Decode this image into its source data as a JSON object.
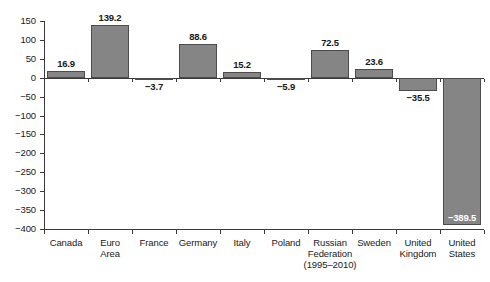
{
  "chart_data": {
    "type": "bar",
    "title": "",
    "subtitle": "",
    "xlabel": "",
    "ylabel": "",
    "ylim": [
      -400,
      150
    ],
    "ytick_step": 50,
    "yticks": [
      150,
      100,
      50,
      0,
      -50,
      -100,
      -150,
      -200,
      -250,
      -300,
      -350,
      -400
    ],
    "ytick_labels": [
      "150",
      "100",
      "50",
      "0",
      "−50",
      "−100",
      "−150",
      "−200",
      "−250",
      "−300",
      "−350",
      "−400"
    ],
    "grid": false,
    "legend": null,
    "categories": [
      "Canada",
      "Euro Area",
      "France",
      "Germany",
      "Italy",
      "Poland",
      "Russian Federation (1995–2010)",
      "Sweden",
      "United Kingdom",
      "United States"
    ],
    "category_label_lines": [
      [
        "Canada"
      ],
      [
        "Euro",
        "Area"
      ],
      [
        "France"
      ],
      [
        "Germany"
      ],
      [
        "Italy"
      ],
      [
        "Poland"
      ],
      [
        "Russian",
        "Federation",
        "(1995–2010)"
      ],
      [
        "Sweden"
      ],
      [
        "United",
        "Kingdom"
      ],
      [
        "United",
        "States"
      ]
    ],
    "values": [
      16.9,
      139.2,
      -3.7,
      88.6,
      15.2,
      -5.9,
      72.5,
      23.6,
      -35.5,
      -389.5
    ],
    "value_labels": [
      "16.9",
      "139.2",
      "−3.7",
      "88.6",
      "15.2",
      "−5.9",
      "72.5",
      "23.6",
      "−35.5",
      "−389.5"
    ],
    "bar_color": "#858585",
    "bar_edge_color": "#4c4c4c",
    "axis_color": "#3a3a3a"
  }
}
